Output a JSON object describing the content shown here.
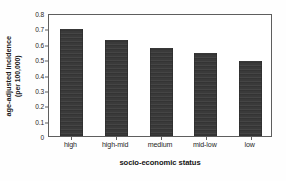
{
  "chart_data": {
    "type": "bar",
    "title": "",
    "categories": [
      "high",
      "high-mid",
      "medium",
      "mid-low",
      "low"
    ],
    "values": [
      0.695,
      0.625,
      0.575,
      0.54,
      0.485
    ],
    "series": [
      {
        "name": "age-adjusted incidence",
        "values": [
          0.695,
          0.625,
          0.575,
          0.54,
          0.485
        ]
      }
    ],
    "xlabel": "socio-economic status",
    "ylabel_line1": "age-adjusted incidence",
    "ylabel_line2": "(per 100,000)",
    "ylabel": "age-adjusted incidence (per 100,000)",
    "ylim": [
      0,
      0.8
    ],
    "yticks": [
      "0.8",
      "0.7",
      "0.6",
      "0.5",
      "0.4",
      "0.3",
      "0.2",
      "0.1",
      "0"
    ],
    "ytick_values": [
      0.8,
      0.7,
      0.6,
      0.5,
      0.4,
      0.3,
      0.2,
      0.1,
      0
    ],
    "grid": false,
    "legend": "none",
    "bar_color": "#3a3a3a",
    "frame_color": "#5e5e5e",
    "background": "#ffffff"
  }
}
